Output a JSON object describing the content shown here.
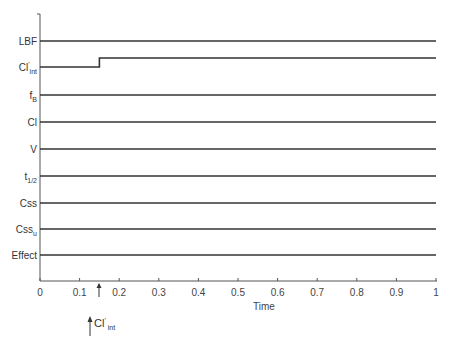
{
  "chart_data": {
    "type": "line",
    "title": "",
    "xlabel": "Time",
    "ylabel": "",
    "xlim": [
      0,
      1
    ],
    "x_ticks": [
      "0",
      "0.1",
      "0.2",
      "0.3",
      "0.4",
      "0.5",
      "0.6",
      "0.7",
      "0.8",
      "0.9",
      "1"
    ],
    "grid": false,
    "legend": null,
    "series": [
      {
        "name": "LBF",
        "label_main": "LBF",
        "label_sub": "",
        "label_sup": "",
        "x": [
          0,
          1
        ],
        "values": [
          1,
          1
        ]
      },
      {
        "name": "Cl'int",
        "label_main": "Cl",
        "label_sub": "int",
        "label_sup": "'",
        "x": [
          0,
          0.15,
          0.15,
          1
        ],
        "values": [
          0,
          0,
          1,
          1
        ]
      },
      {
        "name": "fB",
        "label_main": "f",
        "label_sub": "B",
        "label_sup": "",
        "x": [
          0,
          1
        ],
        "values": [
          1,
          1
        ]
      },
      {
        "name": "Cl",
        "label_main": "Cl",
        "label_sub": "",
        "label_sup": "",
        "x": [
          0,
          1
        ],
        "values": [
          1,
          1
        ]
      },
      {
        "name": "V",
        "label_main": "V",
        "label_sub": "",
        "label_sup": "",
        "x": [
          0,
          1
        ],
        "values": [
          1,
          1
        ]
      },
      {
        "name": "t1/2",
        "label_main": "t",
        "label_sub": "1/2",
        "label_sup": "",
        "x": [
          0,
          1
        ],
        "values": [
          1,
          1
        ]
      },
      {
        "name": "Css",
        "label_main": "Css",
        "label_sub": "",
        "label_sup": "",
        "x": [
          0,
          1
        ],
        "values": [
          1,
          1
        ]
      },
      {
        "name": "Cssu",
        "label_main": "Css",
        "label_sub": "u",
        "label_sup": "",
        "x": [
          0,
          1
        ],
        "values": [
          1,
          1
        ]
      },
      {
        "name": "Effect",
        "label_main": "Effect",
        "label_sub": "",
        "label_sup": "",
        "x": [
          0,
          1
        ],
        "values": [
          1,
          1
        ]
      }
    ],
    "annotations": [
      {
        "text": "Cl'int",
        "type": "arrow-up",
        "x": 0.15,
        "note": "step increase in intrinsic clearance"
      }
    ]
  },
  "annotation": {
    "main": "Cl",
    "sup": "'",
    "sub": "int"
  }
}
